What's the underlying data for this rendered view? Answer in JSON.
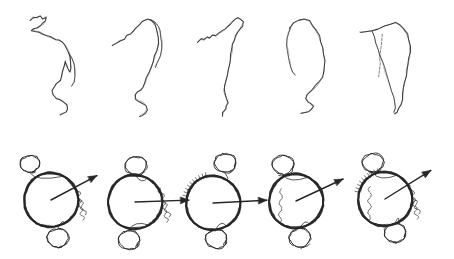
{
  "figure": {
    "title": "",
    "caption": "",
    "background_color": "#ffffff",
    "ink_color": "#3a3a3a",
    "ink_color_dark": "#262626",
    "width": 454,
    "height": 259,
    "rows": [
      {
        "name": "contour-trace-row",
        "label": "",
        "panel_count": 5,
        "description": "hand-drawn open contour traces"
      },
      {
        "name": "circle-arrow-row",
        "label": "",
        "panel_count": 5,
        "description": "sketched circles with orientation arrows and satellite blobs"
      }
    ]
  },
  "chart_data": {
    "type": "line",
    "title": "",
    "subtitle": "",
    "xlabel": "",
    "ylabel": "",
    "grid": false,
    "legend": [],
    "panels_top": [
      {
        "id": "trace-1",
        "label": "",
        "ox": 12,
        "oy": 6,
        "points": [
          [
            18,
            14
          ],
          [
            21,
            11
          ],
          [
            25,
            12
          ],
          [
            28,
            10
          ],
          [
            31,
            13
          ],
          [
            34,
            11
          ],
          [
            33,
            15
          ],
          [
            31,
            18
          ],
          [
            28,
            20
          ],
          [
            25,
            22
          ],
          [
            22,
            23
          ],
          [
            20,
            24
          ],
          [
            23,
            25
          ],
          [
            27,
            26
          ],
          [
            31,
            28
          ],
          [
            35,
            30
          ],
          [
            39,
            31
          ],
          [
            43,
            33
          ],
          [
            47,
            34
          ],
          [
            50,
            36
          ],
          [
            53,
            39
          ],
          [
            55,
            43
          ],
          [
            57,
            47
          ],
          [
            58,
            52
          ],
          [
            59,
            57
          ],
          [
            59,
            62
          ],
          [
            58,
            66
          ],
          [
            56,
            63
          ],
          [
            54,
            59
          ],
          [
            53,
            55
          ],
          [
            52,
            60
          ],
          [
            51,
            66
          ],
          [
            50,
            71
          ],
          [
            48,
            75
          ],
          [
            45,
            78
          ],
          [
            42,
            81
          ],
          [
            40,
            85
          ],
          [
            41,
            89
          ],
          [
            44,
            92
          ],
          [
            48,
            94
          ],
          [
            52,
            96
          ],
          [
            55,
            99
          ],
          [
            56,
            103
          ],
          [
            54,
            106
          ],
          [
            51,
            108
          ],
          [
            48,
            109
          ]
        ],
        "branch": [
          [
            57,
            47
          ],
          [
            60,
            52
          ],
          [
            62,
            58
          ],
          [
            63,
            64
          ],
          [
            63,
            70
          ],
          [
            62,
            76
          ],
          [
            60,
            80
          ]
        ]
      },
      {
        "id": "trace-2",
        "label": "",
        "ox": 98,
        "oy": 6,
        "points": [
          [
            14,
            40
          ],
          [
            18,
            37
          ],
          [
            22,
            35
          ],
          [
            26,
            33
          ],
          [
            29,
            30
          ],
          [
            32,
            28
          ],
          [
            35,
            25
          ],
          [
            38,
            22
          ],
          [
            41,
            19
          ],
          [
            44,
            16
          ],
          [
            47,
            14
          ],
          [
            50,
            13
          ],
          [
            53,
            14
          ],
          [
            56,
            17
          ],
          [
            58,
            21
          ],
          [
            59,
            26
          ],
          [
            60,
            32
          ],
          [
            60,
            38
          ],
          [
            59,
            44
          ],
          [
            57,
            50
          ],
          [
            55,
            56
          ],
          [
            53,
            62
          ],
          [
            51,
            67
          ],
          [
            49,
            72
          ],
          [
            47,
            77
          ],
          [
            45,
            81
          ],
          [
            42,
            84
          ],
          [
            39,
            86
          ],
          [
            37,
            89
          ],
          [
            38,
            93
          ],
          [
            41,
            95
          ],
          [
            45,
            97
          ],
          [
            48,
            100
          ],
          [
            49,
            104
          ],
          [
            47,
            107
          ],
          [
            44,
            109
          ],
          [
            41,
            110
          ]
        ],
        "branch": [
          [
            53,
            14
          ],
          [
            57,
            16
          ],
          [
            60,
            20
          ],
          [
            62,
            25
          ],
          [
            63,
            31
          ],
          [
            64,
            37
          ],
          [
            64,
            43
          ],
          [
            63,
            49
          ],
          [
            61,
            54
          ],
          [
            59,
            58
          ],
          [
            57,
            61
          ]
        ]
      },
      {
        "id": "trace-3",
        "label": "",
        "ox": 186,
        "oy": 6,
        "points": [
          [
            12,
            36
          ],
          [
            15,
            33
          ],
          [
            18,
            34
          ],
          [
            21,
            31
          ],
          [
            24,
            32
          ],
          [
            27,
            29
          ],
          [
            30,
            30
          ],
          [
            33,
            27
          ],
          [
            36,
            25
          ],
          [
            39,
            23
          ],
          [
            42,
            21
          ],
          [
            44,
            18
          ],
          [
            46,
            15
          ],
          [
            49,
            13
          ],
          [
            52,
            12
          ],
          [
            55,
            13
          ],
          [
            57,
            16
          ],
          [
            56,
            20
          ],
          [
            54,
            23
          ],
          [
            52,
            26
          ],
          [
            50,
            30
          ],
          [
            48,
            34
          ],
          [
            47,
            39
          ],
          [
            46,
            44
          ],
          [
            45,
            49
          ],
          [
            44,
            54
          ],
          [
            43,
            59
          ],
          [
            42,
            64
          ],
          [
            41,
            69
          ],
          [
            40,
            74
          ],
          [
            39,
            79
          ],
          [
            38,
            84
          ],
          [
            39,
            88
          ],
          [
            41,
            92
          ],
          [
            42,
            96
          ],
          [
            41,
            100
          ],
          [
            39,
            104
          ],
          [
            37,
            107
          ],
          [
            36,
            110
          ]
        ],
        "branch": []
      },
      {
        "id": "trace-4",
        "label": "",
        "ox": 268,
        "oy": 6,
        "points": [
          [
            22,
            22
          ],
          [
            26,
            17
          ],
          [
            31,
            14
          ],
          [
            36,
            13
          ],
          [
            41,
            15
          ],
          [
            45,
            19
          ],
          [
            48,
            24
          ],
          [
            51,
            30
          ],
          [
            53,
            36
          ],
          [
            55,
            42
          ],
          [
            56,
            48
          ],
          [
            57,
            54
          ],
          [
            57,
            60
          ],
          [
            56,
            66
          ],
          [
            54,
            71
          ],
          [
            51,
            76
          ],
          [
            48,
            80
          ],
          [
            45,
            83
          ],
          [
            42,
            86
          ],
          [
            39,
            89
          ],
          [
            38,
            93
          ],
          [
            40,
            96
          ],
          [
            43,
            98
          ],
          [
            46,
            100
          ],
          [
            44,
            103
          ],
          [
            40,
            105
          ],
          [
            36,
            106
          ],
          [
            33,
            107
          ]
        ],
        "branch": [
          [
            22,
            22
          ],
          [
            20,
            27
          ],
          [
            19,
            33
          ],
          [
            19,
            39
          ],
          [
            20,
            45
          ],
          [
            21,
            51
          ],
          [
            22,
            57
          ],
          [
            23,
            62
          ],
          [
            25,
            66
          ],
          [
            27,
            69
          ]
        ]
      },
      {
        "id": "trace-5",
        "label": "",
        "ox": 352,
        "oy": 6,
        "points": [
          [
            8,
            26
          ],
          [
            14,
            26
          ],
          [
            20,
            25
          ],
          [
            26,
            23
          ],
          [
            32,
            20
          ],
          [
            38,
            18
          ],
          [
            44,
            17
          ],
          [
            48,
            19
          ],
          [
            52,
            23
          ],
          [
            55,
            28
          ],
          [
            57,
            34
          ],
          [
            58,
            40
          ],
          [
            58,
            46
          ],
          [
            57,
            52
          ],
          [
            56,
            58
          ],
          [
            55,
            64
          ],
          [
            54,
            70
          ],
          [
            53,
            76
          ],
          [
            52,
            82
          ],
          [
            51,
            88
          ],
          [
            50,
            94
          ],
          [
            49,
            99
          ],
          [
            47,
            103
          ],
          [
            45,
            106
          ],
          [
            43,
            108
          ]
        ],
        "branch": [
          [
            20,
            25
          ],
          [
            22,
            31
          ],
          [
            24,
            37
          ],
          [
            26,
            43
          ],
          [
            28,
            49
          ],
          [
            30,
            55
          ],
          [
            32,
            61
          ],
          [
            34,
            67
          ],
          [
            36,
            73
          ],
          [
            38,
            79
          ],
          [
            40,
            85
          ],
          [
            42,
            91
          ],
          [
            43,
            97
          ],
          [
            43,
            102
          ],
          [
            42,
            106
          ]
        ],
        "branch2": [
          [
            30,
            28
          ],
          [
            30,
            34
          ],
          [
            29,
            40
          ],
          [
            29,
            46
          ],
          [
            28,
            52
          ],
          [
            28,
            58
          ],
          [
            27,
            64
          ],
          [
            27,
            70
          ]
        ]
      }
    ],
    "panels_bottom": [
      {
        "id": "circle-1",
        "label": "",
        "cx": 51,
        "cy": 200,
        "r": 27,
        "arrow_angle_deg": -28,
        "arrow_length": 52,
        "top_blob": {
          "x": 30,
          "y": 164,
          "r": 9
        },
        "bottom_blob": {
          "x": 58,
          "y": 238,
          "r": 10
        },
        "squiggle_side": "right"
      },
      {
        "id": "circle-2",
        "label": "",
        "cx": 135,
        "cy": 202,
        "r": 27,
        "arrow_angle_deg": -2,
        "arrow_length": 54,
        "top_blob": {
          "x": 136,
          "y": 166,
          "r": 10
        },
        "bottom_blob": {
          "x": 129,
          "y": 240,
          "r": 10
        },
        "squiggle_side": "right"
      },
      {
        "id": "circle-3",
        "label": "",
        "cx": 213,
        "cy": 203,
        "r": 27,
        "arrow_angle_deg": -3,
        "arrow_length": 54,
        "top_blob": {
          "x": 225,
          "y": 163,
          "r": 10
        },
        "bottom_blob": {
          "x": 216,
          "y": 239,
          "r": 10
        },
        "squiggle_side": "top-left"
      },
      {
        "id": "circle-4",
        "label": "",
        "cx": 296,
        "cy": 201,
        "r": 27,
        "arrow_angle_deg": -25,
        "arrow_length": 52,
        "top_blob": {
          "x": 283,
          "y": 165,
          "r": 10
        },
        "bottom_blob": {
          "x": 300,
          "y": 238,
          "r": 10
        },
        "squiggle_side": "left"
      },
      {
        "id": "circle-5",
        "label": "",
        "cx": 385,
        "cy": 199,
        "r": 27,
        "arrow_angle_deg": -32,
        "arrow_length": 54,
        "top_blob": {
          "x": 373,
          "y": 163,
          "r": 10
        },
        "bottom_blob": {
          "x": 395,
          "y": 233,
          "r": 10
        },
        "squiggle_side": "center"
      }
    ]
  }
}
